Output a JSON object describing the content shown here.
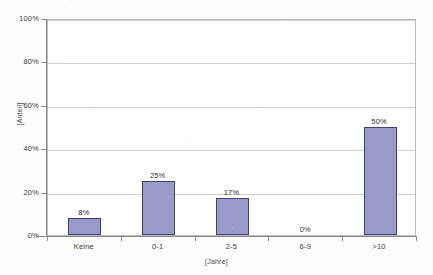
{
  "chart_data": {
    "type": "bar",
    "title": "",
    "categories": [
      "Keine",
      "0-1",
      "2-5",
      "6-9",
      ">10"
    ],
    "values": [
      8,
      25,
      17,
      0,
      50
    ],
    "value_labels": [
      "8%",
      "25%",
      "17%",
      "0%",
      "50%"
    ],
    "xlabel": "[Jahre]",
    "ylabel": "[Anteil]",
    "ylim": [
      0,
      100
    ],
    "ytick_values": [
      0,
      20,
      40,
      60,
      80,
      100
    ],
    "ytick_labels": [
      "0%",
      "20%",
      "40%",
      "60%",
      "80%",
      "100%"
    ],
    "grid": "horizontal",
    "legend": "none",
    "series": [
      {
        "name": "Anteil",
        "values": [
          8,
          25,
          17,
          0,
          50
        ],
        "color": "#9a99c9",
        "border_color": "#44416f"
      }
    ]
  },
  "axes": {
    "y_title": "[Anteil]",
    "x_title": "[Jahre]"
  },
  "colors": {
    "bar_fill": "#9a99c9",
    "bar_border": "#44416f",
    "gridline": "#cfcfcf",
    "axis": "#8d8d8d",
    "plot_background": "#ffffff",
    "page_background": "#fdfdfd"
  }
}
